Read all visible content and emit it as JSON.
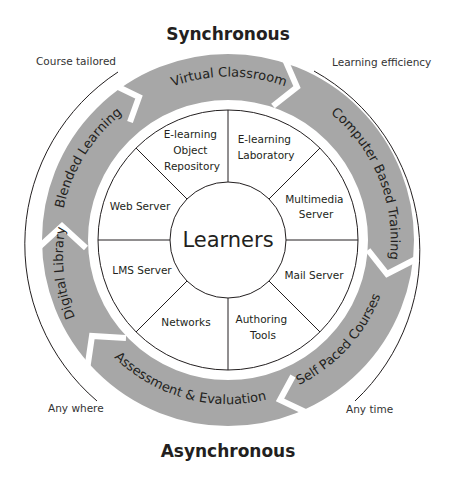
{
  "diagram": {
    "title_top": "Synchronous",
    "title_bottom": "Asynchronous",
    "corner_labels": {
      "top_left": "Course tailored",
      "top_right": "Learning efficiency",
      "bottom_left": "Any where",
      "bottom_right": "Any time"
    },
    "center": "Learners",
    "outer_ring": [
      {
        "label": "Virtual Classroom"
      },
      {
        "label": "Computer Based Training"
      },
      {
        "label": "Self Paced Courses"
      },
      {
        "label": "Assessment & Evaluation"
      },
      {
        "label": "Digital Library"
      },
      {
        "label": "Blended Learning"
      }
    ],
    "inner_ring": [
      {
        "lines": [
          "E-learning",
          "Laboratory"
        ]
      },
      {
        "lines": [
          "Multimedia",
          "Server"
        ]
      },
      {
        "lines": [
          "Mail Server"
        ]
      },
      {
        "lines": [
          "Authoring",
          "Tools"
        ]
      },
      {
        "lines": [
          "Networks"
        ]
      },
      {
        "lines": [
          "LMS Server"
        ]
      },
      {
        "lines": [
          "Web Server"
        ]
      },
      {
        "lines": [
          "E-learning",
          "Object",
          "Repository"
        ]
      }
    ],
    "colors": {
      "ring_fill": "#a7a7a7",
      "line": "#231f20",
      "background": "#ffffff"
    }
  }
}
